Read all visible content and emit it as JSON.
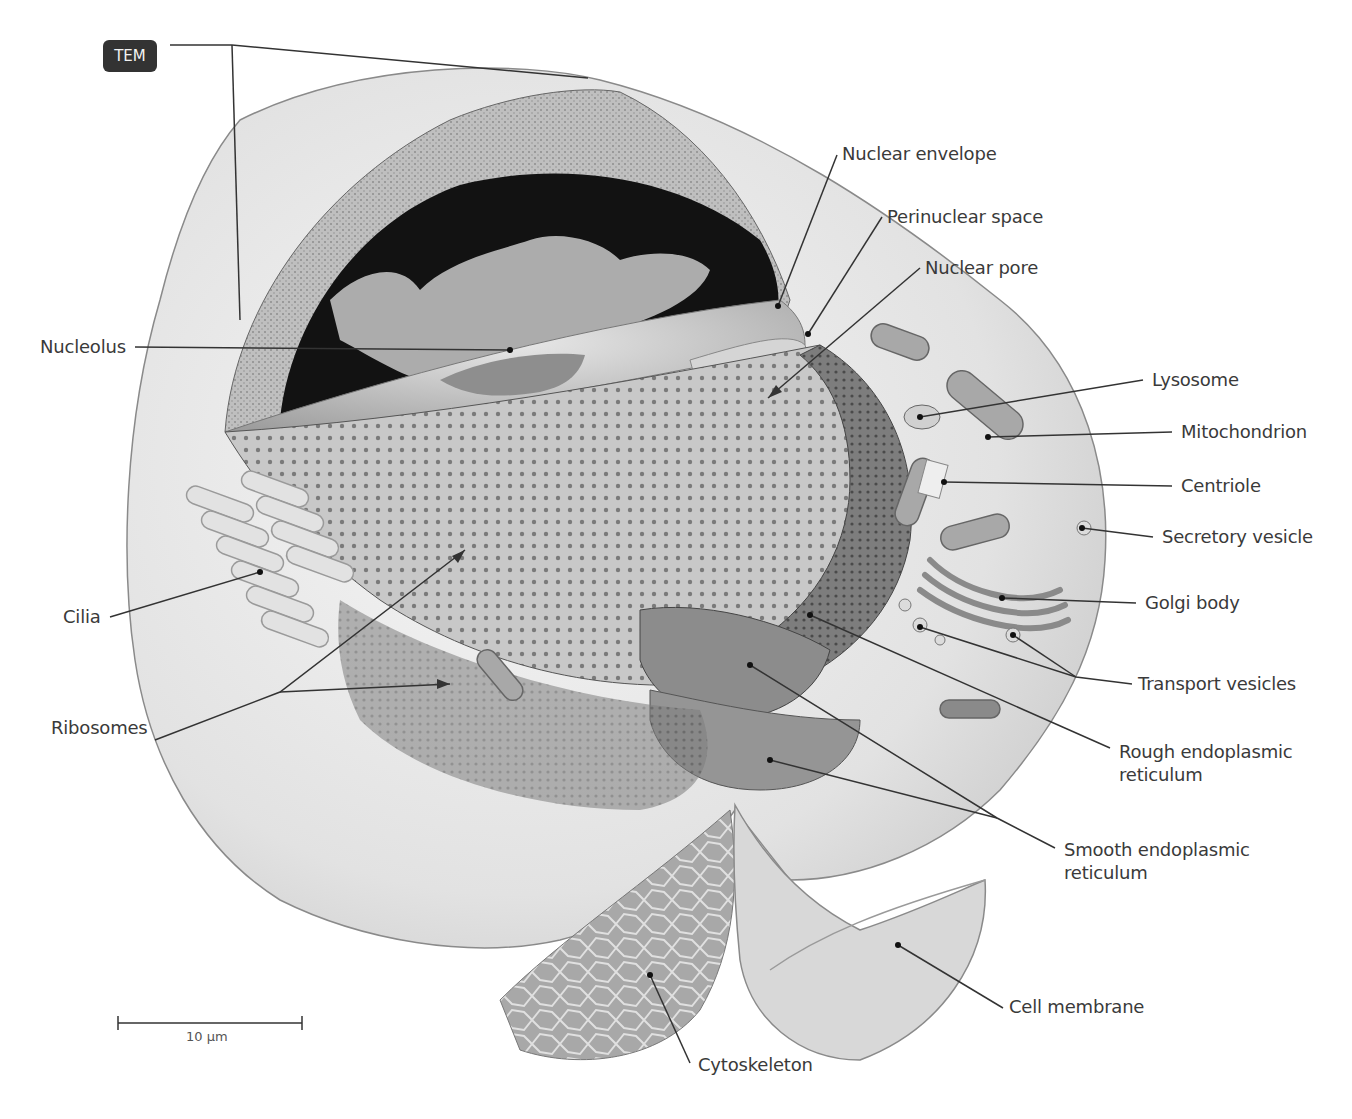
{
  "figure": {
    "badge": "TEM",
    "scale_bar": {
      "label": "10 μm",
      "x1": 118,
      "x2": 302,
      "y": 1023
    },
    "colors": {
      "background": "#ffffff",
      "label_text": "#3a3a3a",
      "leader_line": "#333333",
      "badge_bg": "#333333",
      "badge_text": "#f2f2f2",
      "cell_membrane": "#e6e6e6",
      "cytoplasm": "#d4d4d4",
      "nucleus_dark": "#111111",
      "chromatin_light": "#cfcfcf",
      "rough_er": "#8a8a8a",
      "nucleus_cut": "#bdbdbd"
    },
    "labels": {
      "nuclear_envelope": "Nuclear envelope",
      "perinuclear_space": "Perinuclear space",
      "nuclear_pore": "Nuclear pore",
      "nucleolus": "Nucleolus",
      "lysosome": "Lysosome",
      "mitochondrion": "Mitochondrion",
      "centriole": "Centriole",
      "secretory_vesicle": "Secretory vesicle",
      "cilia": "Cilia",
      "golgi_body": "Golgi body",
      "transport_vesicles": "Transport vesicles",
      "ribosomes": "Ribosomes",
      "rough_er_line1": "Rough endoplasmic",
      "rough_er_line2": "reticulum",
      "smooth_er_line1": "Smooth endoplasmic",
      "smooth_er_line2": "reticulum",
      "cell_membrane": "Cell membrane",
      "cytoskeleton": "Cytoskeleton"
    }
  }
}
